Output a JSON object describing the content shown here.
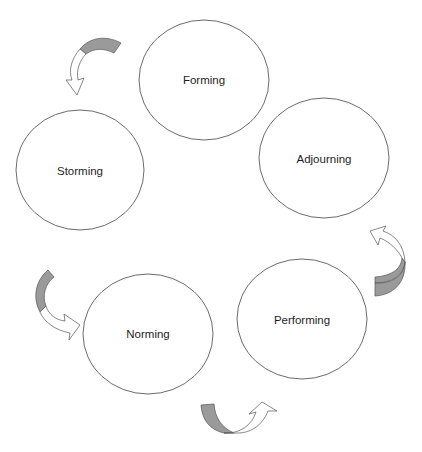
{
  "diagram": {
    "type": "cycle",
    "colors": {
      "outline": "#5a5a5a",
      "arrow_shaded": "#9a9a9a",
      "arrow_unshaded": "#ffffff",
      "text": "#1e1e1e",
      "background": "#ffffff"
    },
    "stages": [
      {
        "id": "forming",
        "label": "Forming"
      },
      {
        "id": "storming",
        "label": "Storming"
      },
      {
        "id": "norming",
        "label": "Norming"
      },
      {
        "id": "performing",
        "label": "Performing"
      },
      {
        "id": "adjourning",
        "label": "Adjourning"
      }
    ],
    "arrows": [
      {
        "from": "forming",
        "to": "storming",
        "style": "curved-two-tone"
      },
      {
        "from": "storming",
        "to": "norming",
        "style": "curved-two-tone"
      },
      {
        "from": "norming",
        "to": "performing",
        "style": "curved-two-tone"
      },
      {
        "from": "performing",
        "to": "adjourning",
        "style": "curved-two-tone"
      }
    ]
  }
}
